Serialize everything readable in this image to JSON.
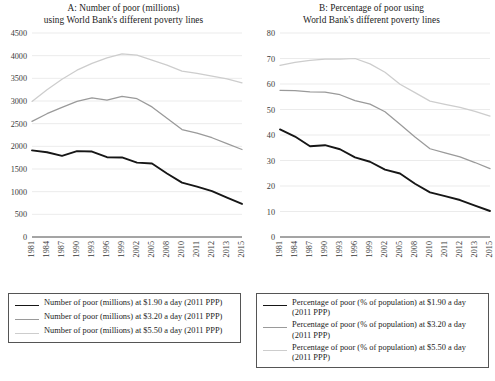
{
  "figure": {
    "panels": [
      {
        "id": "A",
        "title_line1": "A: Number of poor (millions)",
        "title_line2": "using World Bank's different poverty lines"
      },
      {
        "id": "B",
        "title_line1": "B: Percentage of poor using",
        "title_line2": "World Bank's different poverty lines"
      }
    ]
  },
  "legend_a": {
    "items": [
      {
        "label": "Number of poor (millions) at $1.90 a day (2011 PPP)",
        "color": "#161616"
      },
      {
        "label": "Number of poor (millions) at $3.20 a day (2011 PPP)",
        "color": "#9a9a9a"
      },
      {
        "label": "Number of poor (millions) at $5.50 a day (2011 PPP)",
        "color": "#cdcdcd"
      }
    ]
  },
  "legend_b": {
    "items": [
      {
        "label": "Percentage of poor (% of population) at $1.90 a day (2011 PPP)",
        "color": "#161616"
      },
      {
        "label": "Percentage of poor (% of population) at $3.20 a day (2011 PPP)",
        "color": "#9a9a9a"
      },
      {
        "label": "Percentage of poor (% of population) at $5.50 a day (2011 PPP)",
        "color": "#cdcdcd"
      }
    ]
  },
  "chart_data": [
    {
      "type": "line",
      "id": "A",
      "title": "A: Number of poor (millions) using World Bank's different poverty lines",
      "xlabel": "",
      "ylabel": "",
      "ylim": [
        0,
        4500
      ],
      "yticks": [
        0,
        500,
        1000,
        1500,
        2000,
        2500,
        3000,
        3500,
        4000,
        4500
      ],
      "grid": true,
      "legend_position": "below",
      "categories": [
        "1981",
        "1984",
        "1987",
        "1990",
        "1993",
        "1996",
        "1999",
        "2002",
        "2005",
        "2008",
        "2010",
        "2011",
        "2012",
        "2013",
        "2015"
      ],
      "series": [
        {
          "name": "Number of poor (millions) at $1.90 a day (2011 PPP)",
          "color": "#161616",
          "values": [
            1910,
            1870,
            1790,
            1895,
            1885,
            1760,
            1755,
            1640,
            1620,
            1400,
            1200,
            1110,
            1010,
            870,
            730
          ]
        },
        {
          "name": "Number of poor (millions) at $3.20 a day (2011 PPP)",
          "color": "#9a9a9a",
          "values": [
            2550,
            2720,
            2860,
            2990,
            3070,
            3020,
            3100,
            3050,
            2870,
            2620,
            2370,
            2290,
            2190,
            2060,
            1930
          ]
        },
        {
          "name": "Number of poor (millions) at $5.50 a day (2011 PPP)",
          "color": "#cdcdcd",
          "values": [
            2990,
            3250,
            3480,
            3680,
            3830,
            3950,
            4040,
            4010,
            3900,
            3790,
            3660,
            3610,
            3550,
            3490,
            3400
          ]
        }
      ]
    },
    {
      "type": "line",
      "id": "B",
      "title": "B: Percentage of poor using World Bank's different poverty lines",
      "xlabel": "",
      "ylabel": "",
      "ylim": [
        0,
        80
      ],
      "yticks": [
        0,
        10,
        20,
        30,
        40,
        50,
        60,
        70,
        80
      ],
      "grid": true,
      "legend_position": "below",
      "categories": [
        "1981",
        "1984",
        "1987",
        "1990",
        "1993",
        "1996",
        "1999",
        "2002",
        "2005",
        "2008",
        "2010",
        "2011",
        "2012",
        "2013",
        "2015"
      ],
      "series": [
        {
          "name": "Percentage of poor (% of population) at $1.90 a day (2011 PPP)",
          "color": "#161616",
          "values": [
            42.2,
            39.4,
            35.6,
            36.0,
            34.4,
            31.2,
            29.5,
            26.4,
            24.9,
            20.9,
            17.5,
            16.0,
            14.5,
            12.3,
            10.2
          ]
        },
        {
          "name": "Percentage of poor (% of population) at $3.20 a day (2011 PPP)",
          "color": "#9a9a9a",
          "values": [
            57.5,
            57.4,
            56.9,
            56.8,
            55.8,
            53.5,
            52.1,
            49.1,
            44.2,
            39.2,
            34.6,
            33.0,
            31.4,
            29.2,
            26.8
          ]
        },
        {
          "name": "Percentage of poor (% of population) at $5.50 a day (2011 PPP)",
          "color": "#cdcdcd",
          "values": [
            67.3,
            68.5,
            69.3,
            69.8,
            69.8,
            70.0,
            67.9,
            64.6,
            59.9,
            56.6,
            53.3,
            52.0,
            50.8,
            49.3,
            47.4
          ]
        }
      ]
    }
  ]
}
